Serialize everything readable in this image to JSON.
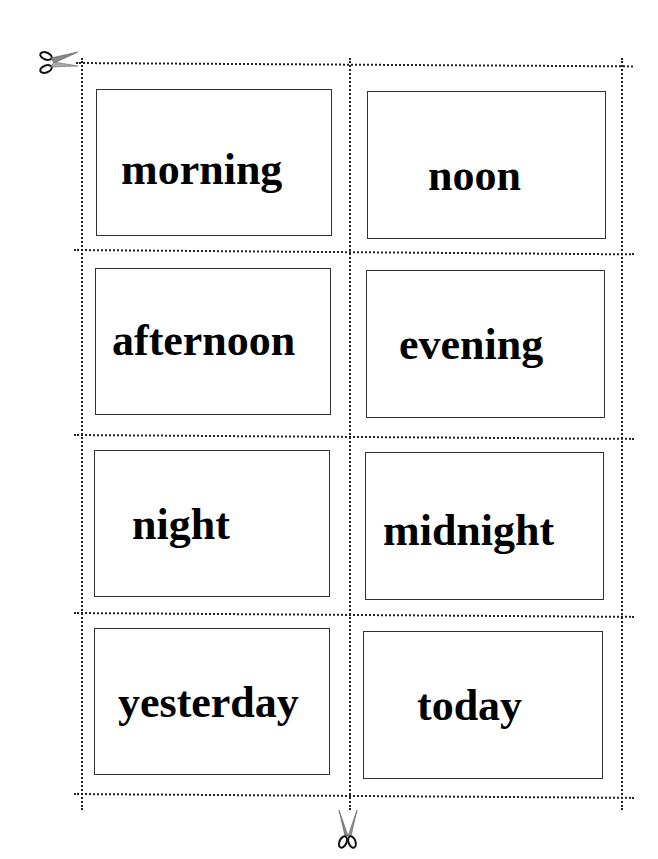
{
  "sheet": {
    "title": "Time-of-day word cards",
    "cards": [
      {
        "label": "morning"
      },
      {
        "label": "noon"
      },
      {
        "label": "afternoon"
      },
      {
        "label": "evening"
      },
      {
        "label": "night"
      },
      {
        "label": "midnight"
      },
      {
        "label": "yesterday"
      },
      {
        "label": "today"
      }
    ],
    "icons": {
      "top_left": "scissors-icon",
      "bottom_center": "scissors-icon"
    },
    "colors": {
      "line": "#222222",
      "card_border": "#333333",
      "text": "#000000",
      "background": "#ffffff"
    }
  }
}
